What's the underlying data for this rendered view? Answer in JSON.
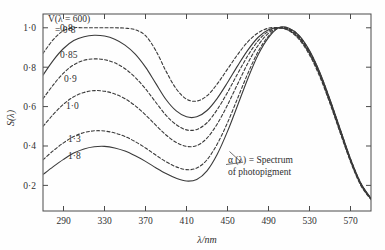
{
  "chart_data": {
    "type": "line",
    "title": "",
    "xlabel": "λ/nm",
    "ylabel": "S(λ)",
    "xlim": [
      270,
      590
    ],
    "ylim": [
      0.07,
      1.07
    ],
    "xticks": [
      290,
      330,
      370,
      410,
      450,
      490,
      530,
      570
    ],
    "xtick_labels": [
      "290",
      "330",
      "370",
      "410",
      "450",
      "490",
      "530",
      "570"
    ],
    "yticks": [
      0.2,
      0.4,
      0.6,
      0.8,
      1.0
    ],
    "ytick_labels": [
      "0·2",
      "0·4",
      "0·6",
      "0·8",
      "1·0"
    ],
    "grid": false,
    "legend_position": "inline-left-labels",
    "legend_title": "V(λ = 600)",
    "legend_title_line1": "V(λ = 600)",
    "legend_title_line2": "= 0·8",
    "annotation": {
      "line1": "α (λ) = Spectrum",
      "line2": "of photopigment",
      "target_x": 452,
      "target_y": 0.372
    },
    "x": [
      270,
      280,
      290,
      300,
      310,
      320,
      330,
      340,
      350,
      360,
      370,
      380,
      390,
      400,
      410,
      420,
      430,
      440,
      450,
      460,
      470,
      480,
      490,
      500,
      510,
      520,
      530,
      540,
      550,
      560,
      570,
      580,
      590
    ],
    "series": [
      {
        "name": "0·8",
        "label": "0·8",
        "style": "dashed",
        "label_x": 60,
        "label_y": 1.0,
        "values": [
          0.87,
          0.94,
          0.985,
          1.0,
          1.0,
          1.0,
          1.0,
          1.0,
          0.998,
          0.99,
          0.96,
          0.885,
          0.78,
          0.69,
          0.638,
          0.628,
          0.655,
          0.715,
          0.79,
          0.865,
          0.93,
          0.975,
          0.998,
          1.0,
          0.985,
          0.94,
          0.862,
          0.752,
          0.615,
          0.465,
          0.32,
          0.2,
          0.128
        ]
      },
      {
        "name": "0·85",
        "label": "0·85",
        "style": "solid",
        "label_x": 60,
        "label_y": 0.865,
        "values": [
          0.76,
          0.835,
          0.895,
          0.935,
          0.955,
          0.962,
          0.958,
          0.942,
          0.912,
          0.866,
          0.8,
          0.718,
          0.636,
          0.578,
          0.548,
          0.548,
          0.58,
          0.642,
          0.722,
          0.808,
          0.888,
          0.952,
          0.99,
          1.0,
          0.988,
          0.946,
          0.87,
          0.76,
          0.622,
          0.472,
          0.325,
          0.205,
          0.13
        ]
      },
      {
        "name": "0·9",
        "label": "0·9",
        "style": "dashed",
        "label_x": 64,
        "label_y": 0.742,
        "values": [
          0.64,
          0.71,
          0.77,
          0.812,
          0.835,
          0.842,
          0.838,
          0.822,
          0.792,
          0.748,
          0.69,
          0.622,
          0.556,
          0.508,
          0.482,
          0.484,
          0.518,
          0.585,
          0.672,
          0.768,
          0.86,
          0.935,
          0.982,
          1.0,
          0.99,
          0.95,
          0.874,
          0.764,
          0.626,
          0.476,
          0.328,
          0.207,
          0.131
        ]
      },
      {
        "name": "1·0",
        "label": "1·0",
        "style": "dashed",
        "label_x": 66,
        "label_y": 0.608,
        "values": [
          0.5,
          0.56,
          0.612,
          0.65,
          0.672,
          0.681,
          0.678,
          0.664,
          0.64,
          0.604,
          0.558,
          0.506,
          0.456,
          0.418,
          0.398,
          0.402,
          0.44,
          0.512,
          0.608,
          0.716,
          0.822,
          0.912,
          0.972,
          1.0,
          0.993,
          0.954,
          0.878,
          0.768,
          0.63,
          0.48,
          0.331,
          0.209,
          0.132
        ]
      },
      {
        "name": "1·3",
        "label": "1·3",
        "style": "dashed",
        "label_x": 68,
        "label_y": 0.436,
        "values": [
          0.33,
          0.376,
          0.416,
          0.448,
          0.468,
          0.477,
          0.476,
          0.466,
          0.448,
          0.422,
          0.39,
          0.354,
          0.32,
          0.294,
          0.28,
          0.288,
          0.33,
          0.41,
          0.518,
          0.644,
          0.77,
          0.88,
          0.958,
          1.0,
          0.996,
          0.958,
          0.882,
          0.772,
          0.634,
          0.483,
          0.334,
          0.211,
          0.133
        ]
      },
      {
        "name": "1·8",
        "label": "1·8",
        "style": "solid",
        "label_x": 68,
        "label_y": 0.352,
        "values": [
          0.255,
          0.295,
          0.332,
          0.364,
          0.385,
          0.396,
          0.398,
          0.39,
          0.374,
          0.35,
          0.322,
          0.29,
          0.26,
          0.236,
          0.222,
          0.23,
          0.274,
          0.358,
          0.474,
          0.608,
          0.744,
          0.864,
          0.95,
          1.0,
          0.998,
          0.96,
          0.884,
          0.774,
          0.636,
          0.485,
          0.335,
          0.212,
          0.134
        ]
      }
    ]
  }
}
